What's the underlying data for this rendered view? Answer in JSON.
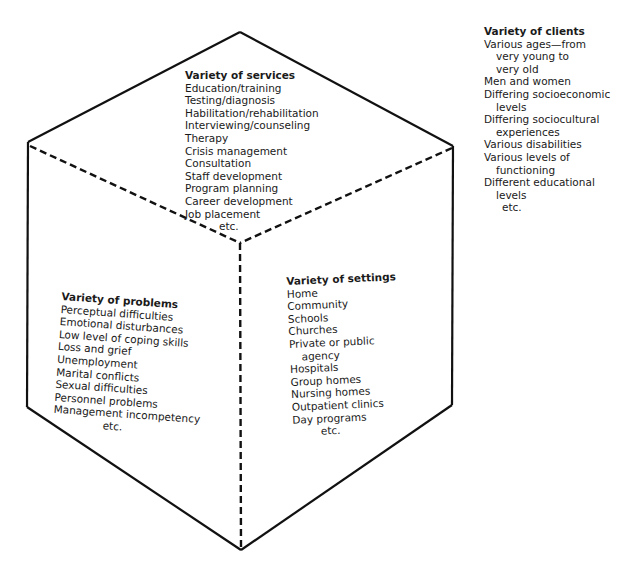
{
  "figure": {
    "type": "cube-diagram",
    "faces": {
      "services": {
        "title": "Variety of services",
        "items": [
          {
            "text": "Education/training"
          },
          {
            "text": "Testing/diagnosis"
          },
          {
            "text": "Habilitation/rehabilitation"
          },
          {
            "text": "Interviewing/counseling"
          },
          {
            "text": "Therapy"
          },
          {
            "text": "Crisis management"
          },
          {
            "text": "Consultation"
          },
          {
            "text": "Staff development"
          },
          {
            "text": "Program planning"
          },
          {
            "text": "Career development"
          },
          {
            "text": "Job placement"
          },
          {
            "text": "etc."
          }
        ]
      },
      "problems": {
        "title": "Variety of problems",
        "items": [
          {
            "text": "Perceptual difficulties"
          },
          {
            "text": "Emotional disturbances"
          },
          {
            "text": "Low level of coping skills"
          },
          {
            "text": "Loss and grief"
          },
          {
            "text": "Unemployment"
          },
          {
            "text": "Marital conflicts"
          },
          {
            "text": "Sexual difficulties"
          },
          {
            "text": "Personnel problems"
          },
          {
            "text": "Management incompetency"
          },
          {
            "text": "etc."
          }
        ]
      },
      "settings": {
        "title": "Variety of settings",
        "items": [
          {
            "text": "Home"
          },
          {
            "text": "Community"
          },
          {
            "text": "Schools"
          },
          {
            "text": "Churches"
          },
          {
            "text": "Private or public"
          },
          {
            "text": "agency"
          },
          {
            "text": "Hospitals"
          },
          {
            "text": "Group homes"
          },
          {
            "text": "Nursing homes"
          },
          {
            "text": "Outpatient clinics"
          },
          {
            "text": "Day programs"
          },
          {
            "text": "etc."
          }
        ]
      }
    },
    "outside": {
      "clients": {
        "title": "Variety of clients",
        "items": [
          {
            "text": "Various ages—from"
          },
          {
            "text": "very young to"
          },
          {
            "text": "very old"
          },
          {
            "text": "Men and women"
          },
          {
            "text": "Differing socioeconomic"
          },
          {
            "text": "levels"
          },
          {
            "text": "Differing sociocultural"
          },
          {
            "text": "experiences"
          },
          {
            "text": "Various disabilities"
          },
          {
            "text": "Various levels of"
          },
          {
            "text": "functioning"
          },
          {
            "text": "Different educational"
          },
          {
            "text": "levels"
          },
          {
            "text": "etc."
          }
        ]
      }
    },
    "colors": {
      "line": "#111111",
      "text": "#1a1a1a",
      "background": "#ffffff"
    }
  }
}
